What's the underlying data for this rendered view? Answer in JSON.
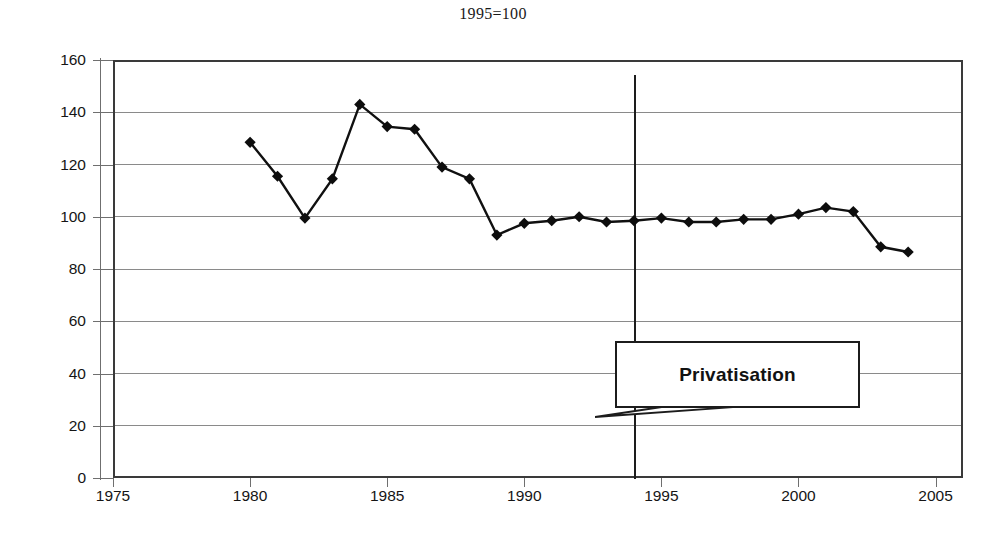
{
  "chart_data": {
    "type": "line",
    "title": "1995=100",
    "xlabel": "",
    "ylabel": "",
    "xlim": [
      1975,
      2006
    ],
    "ylim": [
      0,
      160
    ],
    "grid": true,
    "legend_position": "none",
    "marker": "diamond",
    "xticks": [
      1975,
      1980,
      1985,
      1990,
      1995,
      2000,
      2005
    ],
    "yticks": [
      0,
      20,
      40,
      60,
      80,
      100,
      120,
      140,
      160
    ],
    "series": [
      {
        "name": "Index (1995=100)",
        "x": [
          1980,
          1981,
          1982,
          1983,
          1984,
          1985,
          1986,
          1987,
          1988,
          1989,
          1990,
          1991,
          1992,
          1993,
          1994,
          1995,
          1996,
          1997,
          1998,
          1999,
          2000,
          2001,
          2002,
          2003,
          2004
        ],
        "values": [
          128.5,
          115.5,
          99.5,
          114.5,
          143.0,
          134.5,
          133.5,
          119.0,
          114.5,
          93.0,
          97.5,
          98.5,
          100.0,
          98.0,
          98.5,
          99.5,
          98.0,
          98.0,
          99.0,
          99.0,
          101.0,
          103.5,
          102.0,
          88.5,
          86.5
        ]
      }
    ],
    "annotations": [
      {
        "label": "Privatisation",
        "type": "callout-box",
        "points_to_x": 1994,
        "points_to_y": 22
      }
    ],
    "reference_lines": [
      {
        "orientation": "vertical",
        "x": 1994
      }
    ]
  }
}
